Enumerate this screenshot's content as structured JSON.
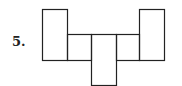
{
  "problem": {
    "number_label": "5.",
    "figure": "net of rectangular prism",
    "rectangles": [
      {
        "name": "left-tall",
        "x": 42,
        "y": 9,
        "w": 25,
        "h": 51
      },
      {
        "name": "middle-left",
        "x": 67,
        "y": 34,
        "w": 24,
        "h": 26
      },
      {
        "name": "center-bottom",
        "x": 91,
        "y": 34,
        "w": 25,
        "h": 51
      },
      {
        "name": "middle-right",
        "x": 116,
        "y": 34,
        "w": 23,
        "h": 26
      },
      {
        "name": "right-tall",
        "x": 139,
        "y": 9,
        "w": 25,
        "h": 51
      }
    ],
    "stroke_color": "#222222"
  }
}
